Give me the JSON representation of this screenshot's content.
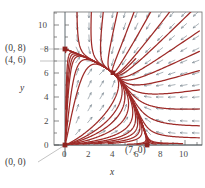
{
  "figure": {
    "kind": "direction-field-phase-portrait",
    "axis_labels": {
      "x": "x",
      "y": "y"
    },
    "x_ticks": [
      "0",
      "2",
      "4",
      "6",
      "8",
      "10"
    ],
    "y_ticks": [
      "0",
      "2",
      "4",
      "6",
      "8",
      "10"
    ],
    "point_labels": [
      {
        "name": "equilibrium-0-8",
        "text": "(0, 8)"
      },
      {
        "name": "equilibrium-4-6",
        "text": "(4, 6)"
      },
      {
        "name": "equilibrium-0-0",
        "text": "(0, 0)"
      },
      {
        "name": "equilibrium-7-0",
        "text": "(7, 0)"
      }
    ],
    "colors": {
      "trajectory": "#9e2b28",
      "arrow": "#7d8a93",
      "frame": "#6b6b6b",
      "axis": "#4f5a60",
      "label": "#3a3a3a",
      "background": "#ffffff"
    }
  },
  "chart_data": {
    "type": "scatter",
    "title": "",
    "xlabel": "x",
    "ylabel": "y",
    "xlim": [
      -0.9,
      11.3
    ],
    "ylim": [
      -1.0,
      11.3
    ],
    "grid": false,
    "xticks": [
      0,
      2,
      4,
      6,
      8,
      10
    ],
    "yticks": [
      0,
      2,
      4,
      6,
      8,
      10
    ],
    "xtick_labels": [
      "0",
      "2",
      "4",
      "6",
      "8",
      "10"
    ],
    "ytick_labels": [
      "0",
      "2",
      "4",
      "6",
      "8",
      "10"
    ],
    "minor_tick_step": 1,
    "equilibria": [
      {
        "label": "(0, 0)",
        "x": 0,
        "y": 0,
        "type": "unstable-node"
      },
      {
        "label": "(0, 8)",
        "x": 0,
        "y": 8,
        "type": "saddle"
      },
      {
        "label": "(7, 0)",
        "x": 7,
        "y": 0,
        "type": "saddle"
      },
      {
        "label": "(4, 6)",
        "x": 4,
        "y": 6,
        "type": "stable-node"
      }
    ],
    "annotations": [
      {
        "text": "(0, 8)",
        "points_to": [
          0,
          8
        ]
      },
      {
        "text": "(4, 6)",
        "points_to": [
          4,
          6
        ]
      },
      {
        "text": "(0, 0)",
        "points_to": [
          0,
          0
        ]
      },
      {
        "text": "(7, 0)",
        "points_to": [
          7,
          0
        ]
      }
    ],
    "vector_field": {
      "description": "arrows on integer lattice x=1..11, y=1..11 pointing toward the stable node at (4,6)",
      "x_samples": [
        1,
        2,
        3,
        4,
        5,
        6,
        7,
        8,
        9,
        10,
        11
      ],
      "y_samples": [
        1,
        2,
        3,
        4,
        5,
        6,
        7,
        8,
        9,
        10,
        11
      ]
    },
    "series": [
      {
        "name": "trajectory-from-(0,8)-to-(4,6)",
        "values": "curve"
      },
      {
        "name": "trajectory-from-(0,0)-to-(4,6)",
        "values": "curve"
      },
      {
        "name": "trajectory-from-(7,0)-to-(4,6)",
        "values": "curve"
      },
      {
        "name": "incoming-trajectories",
        "values": "family of curves converging to (4,6)"
      }
    ]
  }
}
